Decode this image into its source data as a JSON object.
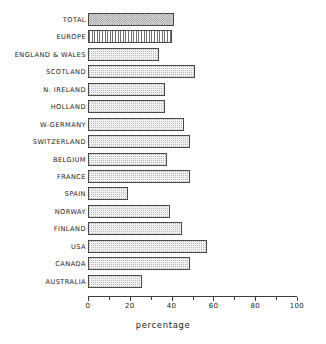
{
  "chart_data": {
    "type": "bar",
    "orientation": "horizontal",
    "title": "",
    "subtitle": "",
    "xlabel": "percentage",
    "ylabel": "",
    "xlim": [
      0,
      100
    ],
    "grid": false,
    "legend": null,
    "categories": [
      "TOTAL",
      "EUROPE",
      "ENGLAND & WALES",
      "SCOTLAND",
      "N. IRELAND",
      "HOLLAND",
      "W-GERMANY",
      "SWITZERLAND",
      "BELGIUM",
      "FRANCE",
      "SPAIN",
      "NORWAY",
      "FINLAND",
      "USA",
      "CANADA",
      "AUSTRALIA"
    ],
    "values": [
      41,
      40,
      34,
      51,
      37,
      37,
      46,
      49,
      38,
      49,
      19,
      39,
      45,
      57,
      49,
      26
    ],
    "bars": [
      {
        "label": "TOTAL",
        "value": 41,
        "fill": "checker"
      },
      {
        "label": "EUROPE",
        "value": 40,
        "fill": "vertical-stripe"
      },
      {
        "label": "ENGLAND & WALES",
        "value": 34,
        "fill": "dots"
      },
      {
        "label": "SCOTLAND",
        "value": 51,
        "fill": "dots"
      },
      {
        "label": "N. IRELAND",
        "value": 37,
        "fill": "dots"
      },
      {
        "label": "HOLLAND",
        "value": 37,
        "fill": "dots"
      },
      {
        "label": "W-GERMANY",
        "value": 46,
        "fill": "dots"
      },
      {
        "label": "SWITZERLAND",
        "value": 49,
        "fill": "dots"
      },
      {
        "label": "BELGIUM",
        "value": 38,
        "fill": "dots"
      },
      {
        "label": "FRANCE",
        "value": 49,
        "fill": "dots"
      },
      {
        "label": "SPAIN",
        "value": 19,
        "fill": "dots"
      },
      {
        "label": "NORWAY",
        "value": 39,
        "fill": "dots"
      },
      {
        "label": "FINLAND",
        "value": 45,
        "fill": "dots"
      },
      {
        "label": "USA",
        "value": 57,
        "fill": "dots"
      },
      {
        "label": "CANADA",
        "value": 49,
        "fill": "dots"
      },
      {
        "label": "AUSTRALIA",
        "value": 26,
        "fill": "dots"
      }
    ],
    "axis": {
      "major_ticks": [
        0,
        20,
        40,
        60,
        80,
        100
      ],
      "major_tick_labels": [
        "0",
        "20",
        "40",
        "60",
        "80",
        "100"
      ],
      "minor_ticks": [
        10,
        30,
        50,
        70,
        90
      ]
    },
    "colors": {
      "bar_outline": "#4a4a4a",
      "bar_fill_light": "#f2f2f2",
      "bar_fill_checker": "#8e8e8e",
      "bar_fill_stripe": "#6f6f6f",
      "axis": "#3d3d3d",
      "text": "#222222",
      "background": "#ffffff"
    }
  }
}
